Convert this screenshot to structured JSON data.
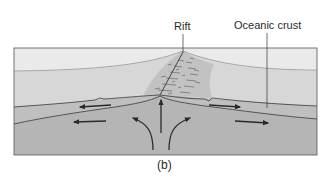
{
  "diagram": {
    "labels": {
      "rift": "Rift",
      "oceanic_crust": "Oceanic crust"
    },
    "caption": "(b)",
    "colors": {
      "sky": "#e8e8e8",
      "water": "#d6d6d6",
      "crust": "#bdbdbd",
      "mantle": "#b3b3b3",
      "ridge_zone": "#c4c4c4",
      "line": "#3a3a3a"
    },
    "arrows": [
      {
        "name": "crust-left-arrow",
        "direction": "left"
      },
      {
        "name": "mantle-left-arrow",
        "direction": "left"
      },
      {
        "name": "crust-right-arrow",
        "direction": "right"
      },
      {
        "name": "mantle-right-arrow",
        "direction": "right"
      },
      {
        "name": "upwelling-center-arrow",
        "direction": "up"
      },
      {
        "name": "upwelling-left-arrow",
        "direction": "up-left"
      },
      {
        "name": "upwelling-right-arrow",
        "direction": "up-right"
      }
    ]
  }
}
